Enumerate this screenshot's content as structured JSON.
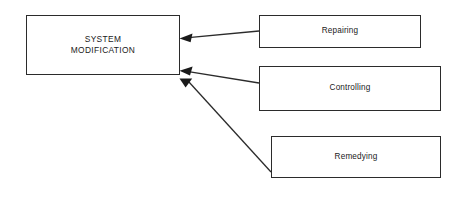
{
  "diagram": {
    "type": "flow-diagram",
    "background_color": "#ffffff",
    "stroke_color": "#2b2b2b",
    "text_color": "#1a1a1a",
    "nodes": [
      {
        "id": "system-modification",
        "label": "SYSTEM\nMODIFICATION",
        "role": "target"
      },
      {
        "id": "repairing",
        "label": "Repairing",
        "role": "source"
      },
      {
        "id": "controlling",
        "label": "Controlling",
        "role": "source"
      },
      {
        "id": "remedying",
        "label": "Remedying",
        "role": "source"
      }
    ],
    "edges": [
      {
        "id": "edge-repairing",
        "from": "repairing",
        "to": "system-modification",
        "arrowhead": "filled-triangle"
      },
      {
        "id": "edge-controlling",
        "from": "controlling",
        "to": "system-modification",
        "arrowhead": "filled-triangle"
      },
      {
        "id": "edge-remedying",
        "from": "remedying",
        "to": "system-modification",
        "arrowhead": "filled-triangle"
      }
    ]
  }
}
